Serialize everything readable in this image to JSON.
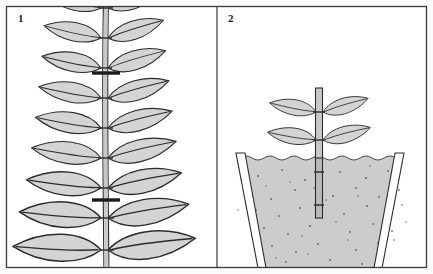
{
  "figure": {
    "width": 433,
    "height": 274,
    "background_color": "#fbfbfa",
    "frame_color": "#3a3a3a",
    "divider_x": 217
  },
  "colors": {
    "leaf_fill": "#d4d4d4",
    "leaf_outline": "#2b2b2b",
    "leaf_vein": "#2b2b2b",
    "stem_fill": "#c8c8c8",
    "stem_outline": "#2b2b2b",
    "cut_mark": "#1a1a1a",
    "soil_fill": "#cccccc",
    "soil_speckle": "#6b6b6b",
    "soil_outline": "#3a3a3a",
    "pot_fill": "#ffffff",
    "pot_outline": "#2b2b2b",
    "frame": "#3a3a3a",
    "background": "#fbfbfa"
  },
  "panels": [
    {
      "id": "panel-1",
      "number": "1",
      "number_x": 18,
      "number_y": 22,
      "subject": "leafy-stem-with-cut-marks",
      "bounds": {
        "x": 6,
        "y": 6,
        "width": 211,
        "height": 262
      },
      "stem": {
        "x": 104,
        "top": 0,
        "bottom": 274,
        "width": 5
      },
      "leaf_pairs": [
        {
          "node_y": 8,
          "leaf_length": 56,
          "leaf_height": 25,
          "tilt": 16
        },
        {
          "node_y": 38,
          "leaf_length": 58,
          "leaf_height": 26,
          "tilt": 15
        },
        {
          "node_y": 68,
          "leaf_length": 60,
          "leaf_height": 27,
          "tilt": 14
        },
        {
          "node_y": 98,
          "leaf_length": 63,
          "leaf_height": 28,
          "tilt": 13
        },
        {
          "node_y": 128,
          "leaf_length": 66,
          "leaf_height": 29,
          "tilt": 12
        },
        {
          "node_y": 158,
          "leaf_length": 70,
          "leaf_height": 31,
          "tilt": 11
        },
        {
          "node_y": 188,
          "leaf_length": 75,
          "leaf_height": 33,
          "tilt": 9
        },
        {
          "node_y": 218,
          "leaf_length": 82,
          "leaf_height": 36,
          "tilt": 7
        },
        {
          "node_y": 250,
          "leaf_length": 88,
          "leaf_height": 38,
          "tilt": 5
        }
      ],
      "cut_marks": [
        {
          "label": "upper-cut",
          "y": 73,
          "x1": 92,
          "x2": 120
        },
        {
          "label": "lower-cut",
          "y": 200,
          "x1": 92,
          "x2": 120
        }
      ]
    },
    {
      "id": "panel-2",
      "number": "2",
      "number_x": 228,
      "number_y": 22,
      "subject": "cutting-planted-in-pot",
      "bounds": {
        "x": 217,
        "y": 6,
        "width": 210,
        "height": 262
      },
      "cutting": {
        "stem_x": 319,
        "stem_top": 88,
        "stem_bottom": 218,
        "stem_width": 7,
        "nodes": [
          {
            "y": 112,
            "label": "upper-node"
          },
          {
            "y": 140,
            "label": "lower-node"
          },
          {
            "y": 172,
            "label": "buried-node-upper"
          },
          {
            "y": 205,
            "label": "buried-node-lower"
          }
        ],
        "leaf_pairs": [
          {
            "node_y": 112,
            "leaf_length": 46,
            "leaf_height": 21,
            "tilt": 14
          },
          {
            "node_y": 140,
            "leaf_length": 48,
            "leaf_height": 22,
            "tilt": 12
          }
        ]
      },
      "pot": {
        "rim_left_x": 236,
        "rim_right_x": 404,
        "base_left_x": 262,
        "base_right_x": 378,
        "rim_y": 153,
        "base_y": 268,
        "wall_thickness": 9
      },
      "soil": {
        "surface_y": 157,
        "wavy_surface": true,
        "speckle_count": 52
      }
    }
  ]
}
